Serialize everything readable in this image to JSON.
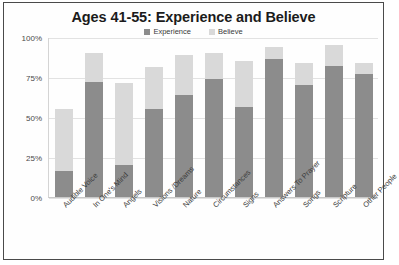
{
  "chart_data": {
    "type": "bar",
    "subtype": "overlaid-stacked",
    "title": "Ages 41-55: Experience and Believe",
    "xlabel": "",
    "ylabel": "",
    "ylim": [
      0,
      100
    ],
    "ytick_labels": [
      "0%",
      "25%",
      "50%",
      "75%",
      "100%"
    ],
    "ytick_values": [
      0,
      25,
      50,
      75,
      100
    ],
    "grid": true,
    "legend_position": "top-center",
    "categories": [
      "Audible Voice",
      "In One's Mind",
      "Angels",
      "Visions /Dreams",
      "Nature",
      "Circumstances",
      "Signs",
      "Answers To Prayer",
      "Songs",
      "Scripture",
      "Other People"
    ],
    "series": [
      {
        "name": "Experience",
        "color": "#8c8c8c",
        "values": [
          16,
          72,
          20,
          55,
          64,
          74,
          56,
          86,
          70,
          82,
          77
        ]
      },
      {
        "name": "Believe",
        "color": "#d9d9d9",
        "values": [
          55,
          90,
          71,
          81,
          89,
          90,
          85,
          94,
          84,
          95,
          84
        ]
      }
    ]
  },
  "legend": {
    "entries": [
      {
        "label": "Experience",
        "swatch": "#8c8c8c"
      },
      {
        "label": "Believe",
        "swatch": "#d9d9d9"
      }
    ]
  }
}
